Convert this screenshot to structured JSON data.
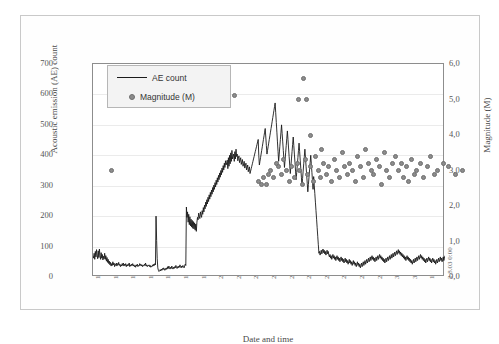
{
  "chart_data": {
    "type": "line",
    "title": "",
    "xlabel": "Date and time",
    "ylabel": "Acoustic emission (AE) count",
    "y2label": "Magnitude (M)",
    "ylim": [
      0,
      700
    ],
    "y2lim": [
      0,
      6.0
    ],
    "grid": true,
    "legend_position": "top-left",
    "yticks": [
      "0",
      "100",
      "200",
      "300",
      "400",
      "500",
      "600",
      "700"
    ],
    "y2ticks": [
      "0,0",
      "1,0",
      "2,0",
      "3,0",
      "4,0",
      "5,0",
      "6,0"
    ],
    "xticks": [
      "13.7.03 0:00",
      "14.7.03 0:00",
      "15.7.03 0:00",
      "16.7.03 0:00",
      "17.7.03 0:00",
      "18.7.03 0:00",
      "19.7.03 0:00",
      "20.7.03 0:00",
      "21.7.03 0:00",
      "22.7.03 0:00",
      "23.7.03 0:00",
      "24.7.03 0:00",
      "25.7.03 0:00",
      "26.7.03 0:00",
      "27.7.03 0:00",
      "28.7.03 0:00",
      "29.7.03 0:00",
      "30.7.03 0:00",
      "31.7.03 0:00",
      "1.8.03 0:00",
      "2.8.03 0:00"
    ],
    "series": [
      {
        "name": "AE count",
        "type": "line",
        "color": "#1a1a1a",
        "axis": "left",
        "values": [
          70,
          62,
          78,
          58,
          84,
          66,
          90,
          72,
          60,
          86,
          64,
          92,
          70,
          58,
          80,
          62,
          74,
          56,
          68,
          60,
          78,
          58,
          70,
          52,
          64,
          48,
          58,
          44,
          52,
          40,
          48,
          36,
          44,
          38,
          50,
          40,
          46,
          34,
          42,
          38,
          46,
          36,
          44,
          40,
          48,
          38,
          42,
          34,
          40,
          36,
          44,
          38,
          46,
          36,
          42,
          38,
          44,
          34,
          40,
          36,
          42,
          38,
          46,
          34,
          40,
          36,
          42,
          38,
          44,
          36,
          40,
          34,
          38,
          32,
          40,
          36,
          42,
          34,
          38,
          36,
          44,
          38,
          42,
          36,
          40,
          34,
          38,
          36,
          42,
          38,
          46,
          36,
          40,
          34,
          38,
          36,
          40,
          34,
          38,
          32,
          36,
          34,
          40,
          36,
          42,
          38,
          44,
          40,
          200,
          120,
          60,
          30,
          22,
          18,
          20,
          24,
          20,
          26,
          22,
          28,
          24,
          30,
          26,
          22,
          28,
          24,
          30,
          26,
          34,
          28,
          36,
          30,
          26,
          32,
          28,
          36,
          30,
          26,
          32,
          28,
          34,
          30,
          38,
          32,
          28,
          34,
          30,
          36,
          32,
          40,
          34,
          30,
          36,
          32,
          38,
          34,
          30,
          36,
          42,
          38,
          230,
          196,
          214,
          180,
          206,
          172,
          198,
          168,
          190,
          164,
          186,
          160,
          182,
          158,
          178,
          154,
          174,
          150,
          180,
          196,
          188,
          210,
          200,
          192,
          214,
          204,
          196,
          218,
          206,
          228,
          214,
          236,
          224,
          246,
          232,
          254,
          240,
          262,
          248,
          270,
          256,
          278,
          264,
          286,
          272,
          294,
          280,
          302,
          288,
          310,
          296,
          318,
          304,
          326,
          312,
          334,
          320,
          342,
          328,
          350,
          336,
          358,
          344,
          366,
          352,
          374,
          360,
          382,
          368,
          376,
          384,
          356,
          392,
          364,
          400,
          372,
          408,
          380,
          416,
          388,
          396,
          404,
          380,
          412,
          388,
          420,
          396,
          404,
          382,
          390,
          398,
          376,
          384,
          392,
          370,
          378,
          386,
          364,
          372,
          380,
          358,
          366,
          374,
          352,
          360,
          368,
          346,
          354,
          362,
          340,
          348,
          356,
          364,
          372,
          380,
          388,
          396,
          404,
          412,
          420,
          428,
          436,
          444,
          452,
          400,
          368,
          380,
          392,
          404,
          416,
          428,
          440,
          452,
          464,
          476,
          488,
          460,
          432,
          404,
          416,
          428,
          440,
          452,
          464,
          476,
          488,
          500,
          512,
          524,
          536,
          548,
          560,
          572,
          540,
          508,
          476,
          444,
          412,
          380,
          404,
          428,
          452,
          476,
          500,
          472,
          444,
          416,
          388,
          360,
          384,
          408,
          432,
          456,
          480,
          452,
          424,
          396,
          368,
          340,
          364,
          388,
          412,
          436,
          460,
          432,
          404,
          376,
          348,
          320,
          344,
          368,
          392,
          416,
          440,
          412,
          384,
          356,
          328,
          300,
          324,
          348,
          372,
          396,
          420,
          392,
          364,
          336,
          308,
          280,
          304,
          328,
          352,
          376,
          400,
          372,
          344,
          316,
          288,
          330,
          302,
          274,
          246,
          218,
          190,
          162,
          134,
          106,
          78,
          84,
          72,
          80,
          88,
          76,
          84,
          92,
          80,
          88,
          76,
          84,
          72,
          80,
          88,
          76,
          84,
          72,
          66,
          74,
          62,
          70,
          58,
          66,
          74,
          62,
          70,
          58,
          66,
          54,
          62,
          70,
          58,
          66,
          54,
          62,
          50,
          58,
          66,
          54,
          62,
          50,
          58,
          46,
          54,
          62,
          50,
          58,
          46,
          54,
          42,
          50,
          58,
          46,
          54,
          42,
          50,
          38,
          46,
          54,
          42,
          50,
          38,
          46,
          34,
          42,
          50,
          38,
          46,
          34,
          42,
          30,
          38,
          46,
          34,
          42,
          50,
          38,
          46,
          54,
          42,
          50,
          58,
          46,
          54,
          62,
          50,
          58,
          66,
          54,
          62,
          70,
          58,
          66,
          54,
          62,
          50,
          58,
          66,
          54,
          62,
          70,
          58,
          66,
          74,
          62,
          70,
          58,
          66,
          54,
          62,
          50,
          58,
          46,
          54,
          62,
          50,
          58,
          66,
          54,
          62,
          70,
          58,
          66,
          74,
          62,
          70,
          78,
          66,
          74,
          82,
          70,
          78,
          86,
          74,
          82,
          90,
          78,
          86,
          74,
          82,
          70,
          78,
          66,
          74,
          62,
          70,
          58,
          66,
          54,
          62,
          70,
          58,
          66,
          54,
          62,
          50,
          58,
          46,
          54,
          42,
          50,
          58,
          46,
          54,
          62,
          50,
          58,
          66,
          54,
          62,
          70,
          58,
          66,
          74,
          62,
          70,
          58,
          66,
          54,
          62,
          50,
          58,
          46,
          54,
          62,
          50,
          58,
          66,
          54,
          62,
          50,
          58,
          46,
          54,
          62,
          50,
          58,
          46,
          54,
          42,
          50,
          58,
          46,
          54,
          62,
          50,
          58,
          66,
          54,
          62,
          50,
          58,
          66,
          54,
          62,
          70
        ]
      },
      {
        "name": "Magnitude (M)",
        "type": "scatter",
        "color": "#8c8c8c",
        "axis": "right",
        "points": [
          {
            "x": 1.05,
            "m": 3.0
          },
          {
            "x": 9.4,
            "m": 2.7
          },
          {
            "x": 9.55,
            "m": 2.6
          },
          {
            "x": 9.7,
            "m": 2.8
          },
          {
            "x": 9.85,
            "m": 2.6
          },
          {
            "x": 9.95,
            "m": 2.9
          },
          {
            "x": 10.1,
            "m": 3.0
          },
          {
            "x": 10.25,
            "m": 2.8
          },
          {
            "x": 10.4,
            "m": 3.2
          },
          {
            "x": 10.55,
            "m": 3.1
          },
          {
            "x": 10.7,
            "m": 2.9
          },
          {
            "x": 10.85,
            "m": 3.3
          },
          {
            "x": 11.0,
            "m": 3.0
          },
          {
            "x": 11.15,
            "m": 2.7
          },
          {
            "x": 11.3,
            "m": 3.1
          },
          {
            "x": 11.45,
            "m": 2.8
          },
          {
            "x": 11.6,
            "m": 3.2
          },
          {
            "x": 11.75,
            "m": 3.0
          },
          {
            "x": 11.9,
            "m": 2.6
          },
          {
            "x": 12.05,
            "m": 3.3
          },
          {
            "x": 12.2,
            "m": 2.9
          },
          {
            "x": 12.35,
            "m": 3.1
          },
          {
            "x": 12.5,
            "m": 2.7
          },
          {
            "x": 12.65,
            "m": 3.4
          },
          {
            "x": 12.8,
            "m": 3.0
          },
          {
            "x": 12.95,
            "m": 2.8
          },
          {
            "x": 13.1,
            "m": 3.2
          },
          {
            "x": 13.25,
            "m": 2.9
          },
          {
            "x": 13.4,
            "m": 3.1
          },
          {
            "x": 13.55,
            "m": 2.7
          },
          {
            "x": 13.7,
            "m": 3.3
          },
          {
            "x": 13.85,
            "m": 3.0
          },
          {
            "x": 14.0,
            "m": 2.8
          },
          {
            "x": 14.15,
            "m": 3.5
          },
          {
            "x": 14.3,
            "m": 3.1
          },
          {
            "x": 14.45,
            "m": 2.9
          },
          {
            "x": 14.6,
            "m": 3.2
          },
          {
            "x": 14.75,
            "m": 3.0
          },
          {
            "x": 14.9,
            "m": 2.7
          },
          {
            "x": 15.05,
            "m": 3.4
          },
          {
            "x": 15.2,
            "m": 3.1
          },
          {
            "x": 15.35,
            "m": 2.8
          },
          {
            "x": 15.5,
            "m": 3.6
          },
          {
            "x": 15.65,
            "m": 3.2
          },
          {
            "x": 15.8,
            "m": 3.0
          },
          {
            "x": 15.95,
            "m": 2.9
          },
          {
            "x": 16.1,
            "m": 3.3
          },
          {
            "x": 16.25,
            "m": 3.1
          },
          {
            "x": 16.4,
            "m": 2.6
          },
          {
            "x": 16.55,
            "m": 3.5
          },
          {
            "x": 16.7,
            "m": 3.0
          },
          {
            "x": 16.85,
            "m": 2.8
          },
          {
            "x": 17.0,
            "m": 3.2
          },
          {
            "x": 8.05,
            "m": 5.1
          },
          {
            "x": 11.95,
            "m": 5.6
          },
          {
            "x": 11.7,
            "m": 5.0
          },
          {
            "x": 12.15,
            "m": 5.0
          },
          {
            "x": 12.35,
            "m": 4.0
          },
          {
            "x": 13.0,
            "m": 3.6
          },
          {
            "x": 17.2,
            "m": 3.4
          },
          {
            "x": 17.35,
            "m": 3.0
          },
          {
            "x": 17.5,
            "m": 3.2
          },
          {
            "x": 17.65,
            "m": 2.8
          },
          {
            "x": 17.8,
            "m": 3.1
          },
          {
            "x": 17.95,
            "m": 2.7
          },
          {
            "x": 18.1,
            "m": 3.3
          },
          {
            "x": 18.25,
            "m": 2.9
          },
          {
            "x": 18.4,
            "m": 3.0
          },
          {
            "x": 18.6,
            "m": 3.2
          },
          {
            "x": 18.8,
            "m": 2.8
          },
          {
            "x": 19.0,
            "m": 3.1
          },
          {
            "x": 19.2,
            "m": 3.4
          },
          {
            "x": 19.4,
            "m": 2.9
          },
          {
            "x": 19.6,
            "m": 3.0
          },
          {
            "x": 19.9,
            "m": 3.2
          },
          {
            "x": 20.2,
            "m": 3.1
          },
          {
            "x": 20.6,
            "m": 2.9
          },
          {
            "x": 21.0,
            "m": 3.0
          }
        ]
      }
    ]
  }
}
